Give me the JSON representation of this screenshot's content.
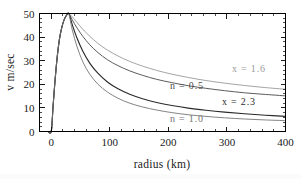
{
  "chart_data": {
    "type": "line",
    "title": "",
    "xlabel": "radius (km)",
    "ylabel": "v m/sec",
    "xlim": [
      -20,
      400
    ],
    "ylim": [
      0,
      50
    ],
    "xticks": [
      0,
      100,
      200,
      300,
      400
    ],
    "yticks": [
      0,
      10,
      20,
      30,
      40,
      50
    ],
    "xtick_labels": [
      "0",
      "100",
      "200",
      "300",
      "400"
    ],
    "ytick_labels": [
      "0",
      "10",
      "20",
      "30",
      "40",
      "50"
    ],
    "grid": false,
    "legend": "inline-annotations",
    "peak_radius_km": 30,
    "peak_velocity_ms": 50,
    "series": [
      {
        "name": "x = 1.6",
        "label": "x = 1.6",
        "color": "#9a9a9a",
        "width": 0.9,
        "label_x": 232,
        "label_y": 72,
        "points": [
          [
            -18,
            0
          ],
          [
            -12,
            0
          ],
          [
            -6,
            0
          ],
          [
            0,
            0
          ],
          [
            3,
            10
          ],
          [
            6,
            20
          ],
          [
            10,
            31
          ],
          [
            14,
            39
          ],
          [
            18,
            44
          ],
          [
            22,
            47.3
          ],
          [
            26,
            49.2
          ],
          [
            30,
            50
          ],
          [
            36,
            48.6
          ],
          [
            44,
            46.2
          ],
          [
            54,
            43.3
          ],
          [
            66,
            40.3
          ],
          [
            80,
            37.3
          ],
          [
            96,
            34.5
          ],
          [
            114,
            32.0
          ],
          [
            134,
            29.7
          ],
          [
            156,
            27.7
          ],
          [
            180,
            25.9
          ],
          [
            206,
            24.3
          ],
          [
            234,
            22.9
          ],
          [
            264,
            21.6
          ],
          [
            296,
            20.5
          ],
          [
            330,
            19.5
          ],
          [
            366,
            18.6
          ],
          [
            400,
            17.9
          ]
        ]
      },
      {
        "name": "n = 0.5",
        "label": "n = 0.5",
        "color": "#4a4a4a",
        "width": 0.9,
        "label_x": 170,
        "label_y": 89,
        "points": [
          [
            -18,
            0
          ],
          [
            -12,
            0
          ],
          [
            -6,
            0
          ],
          [
            0,
            0
          ],
          [
            3,
            10
          ],
          [
            6,
            20
          ],
          [
            10,
            31
          ],
          [
            14,
            39
          ],
          [
            18,
            44
          ],
          [
            22,
            47.3
          ],
          [
            26,
            49.2
          ],
          [
            30,
            50
          ],
          [
            36,
            47.3
          ],
          [
            44,
            43.9
          ],
          [
            54,
            40.3
          ],
          [
            66,
            36.7
          ],
          [
            80,
            33.4
          ],
          [
            96,
            30.4
          ],
          [
            114,
            27.9
          ],
          [
            134,
            25.7
          ],
          [
            156,
            23.8
          ],
          [
            180,
            22.1
          ],
          [
            206,
            20.7
          ],
          [
            234,
            19.4
          ],
          [
            264,
            18.3
          ],
          [
            296,
            17.3
          ],
          [
            330,
            16.4
          ],
          [
            366,
            15.7
          ],
          [
            400,
            15.1
          ]
        ]
      },
      {
        "name": "x = 2.3",
        "label": "x = 2.3",
        "color": "#2a2a2a",
        "width": 1.15,
        "label_x": 222,
        "label_y": 105,
        "points": [
          [
            -18,
            0
          ],
          [
            -12,
            0
          ],
          [
            -6,
            0
          ],
          [
            0,
            0
          ],
          [
            3,
            10
          ],
          [
            6,
            20
          ],
          [
            10,
            31
          ],
          [
            14,
            39
          ],
          [
            18,
            44
          ],
          [
            22,
            47.3
          ],
          [
            26,
            49.2
          ],
          [
            30,
            50
          ],
          [
            36,
            45.2
          ],
          [
            44,
            39.6
          ],
          [
            54,
            34.0
          ],
          [
            66,
            28.9
          ],
          [
            80,
            24.6
          ],
          [
            96,
            21.0
          ],
          [
            114,
            18.1
          ],
          [
            134,
            15.8
          ],
          [
            156,
            13.9
          ],
          [
            180,
            12.3
          ],
          [
            206,
            11.0
          ],
          [
            234,
            9.9
          ],
          [
            264,
            9.0
          ],
          [
            296,
            8.2
          ],
          [
            330,
            7.5
          ],
          [
            366,
            6.9
          ],
          [
            400,
            6.4
          ]
        ]
      },
      {
        "name": "n = 1.0",
        "label": "n = 1.0",
        "color": "#757575",
        "width": 0.9,
        "label_x": 170,
        "label_y": 122,
        "points": [
          [
            -18,
            0
          ],
          [
            -12,
            0
          ],
          [
            -6,
            0
          ],
          [
            0,
            0
          ],
          [
            3,
            10
          ],
          [
            6,
            20
          ],
          [
            10,
            31
          ],
          [
            14,
            39
          ],
          [
            18,
            44
          ],
          [
            22,
            47.3
          ],
          [
            26,
            49.2
          ],
          [
            30,
            50
          ],
          [
            36,
            43.0
          ],
          [
            44,
            36.0
          ],
          [
            54,
            29.5
          ],
          [
            66,
            24.2
          ],
          [
            80,
            20.0
          ],
          [
            96,
            16.7
          ],
          [
            114,
            14.1
          ],
          [
            134,
            12.0
          ],
          [
            156,
            10.4
          ],
          [
            180,
            9.1
          ],
          [
            206,
            8.0
          ],
          [
            234,
            7.1
          ],
          [
            264,
            6.4
          ],
          [
            296,
            5.8
          ],
          [
            330,
            5.3
          ],
          [
            366,
            4.9
          ],
          [
            400,
            4.6
          ]
        ]
      }
    ]
  }
}
